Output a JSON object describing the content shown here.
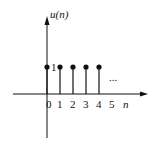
{
  "diagram": {
    "title": "u(n)",
    "y_axis_label": "u(n)",
    "x_axis_label": "n",
    "value_label": "1",
    "ellipsis": "...",
    "tick_labels": [
      "0",
      "1",
      "2",
      "3",
      "4",
      "5"
    ],
    "samples": [
      {
        "n": 0,
        "value": 1
      },
      {
        "n": 1,
        "value": 1
      },
      {
        "n": 2,
        "value": 1
      },
      {
        "n": 3,
        "value": 1
      },
      {
        "n": 4,
        "value": 1
      }
    ],
    "colors": {
      "stroke": "#111111",
      "background": "#ffffff"
    }
  }
}
